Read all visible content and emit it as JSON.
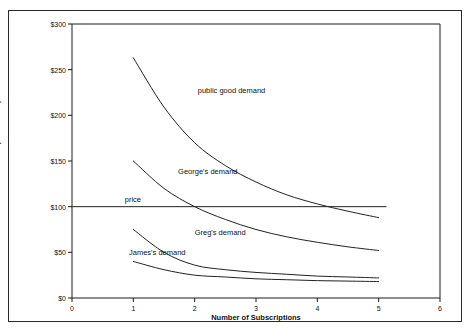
{
  "chart_data": {
    "type": "line",
    "title": "",
    "xlabel": "Number of Subscriptions",
    "ylabel": "Cost per Subscription",
    "xlim": [
      0,
      6
    ],
    "ylim": [
      0,
      300
    ],
    "grid": false,
    "legend_position": "inline-annotations",
    "xticks": [
      "0",
      "1",
      "2",
      "3",
      "4",
      "5",
      "6"
    ],
    "xtick_values": [
      0,
      1,
      2,
      3,
      4,
      5,
      6
    ],
    "yticks": [
      "$0",
      "$50",
      "$100",
      "$150",
      "$200",
      "$250",
      "$300"
    ],
    "ytick_values": [
      0,
      50,
      100,
      150,
      200,
      250,
      300
    ],
    "series": [
      {
        "name": "public good demand",
        "label": "public good demand",
        "x": [
          1,
          1.5,
          2,
          2.5,
          3,
          3.5,
          4,
          4.5,
          5
        ],
        "values": [
          263,
          209,
          170,
          145,
          127,
          113,
          103,
          95,
          88
        ],
        "label_x": 2.05,
        "label_y": 232
      },
      {
        "name": "George's demand",
        "label": "George's demand",
        "x": [
          1,
          1.5,
          2,
          2.5,
          3,
          3.5,
          4,
          4.5,
          5
        ],
        "values": [
          150,
          120,
          100,
          86,
          75,
          67,
          61,
          56,
          52
        ],
        "label_x": 1.73,
        "label_y": 143
      },
      {
        "name": "price",
        "label": "price",
        "x": [
          0,
          5.12
        ],
        "values": [
          100,
          100
        ],
        "label_x": 0.86,
        "label_y": 113
      },
      {
        "name": "Greg's demand",
        "label": "Greg's demand",
        "x": [
          1,
          1.5,
          2,
          2.5,
          3,
          3.5,
          4,
          4.5,
          5
        ],
        "values": [
          75,
          50,
          36,
          31,
          28,
          26,
          24,
          23,
          22
        ],
        "label_x": 2.0,
        "label_y": 77
      },
      {
        "name": "James's demand",
        "label": "James's demand",
        "x": [
          1,
          1.5,
          2,
          2.5,
          3,
          3.5,
          4,
          4.5,
          5
        ],
        "values": [
          40,
          31,
          25,
          23,
          21,
          20,
          19,
          18.5,
          18
        ],
        "label_x": 0.93,
        "label_y": 55
      }
    ],
    "colors": {
      "curve": "#222222",
      "axis": "#1a1a1a",
      "frame": "#2a2a2a",
      "text": "#111111",
      "background": "#ffffff"
    }
  }
}
